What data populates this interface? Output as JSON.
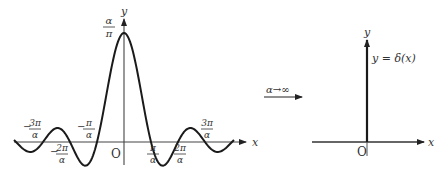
{
  "left_plot": {
    "x_axis_label": "x",
    "y_axis_label": "y",
    "origin_label": "O",
    "peak_label": {
      "num": "α",
      "den": "π"
    },
    "tick_labels": [
      {
        "sign": "−",
        "num": "3π",
        "den": "α",
        "x": 43,
        "pos": "above"
      },
      {
        "sign": "−",
        "num": "2π",
        "den": "α",
        "x": 70,
        "pos": "below"
      },
      {
        "sign": "−",
        "num": "π",
        "den": "α",
        "x": 97,
        "pos": "above"
      },
      {
        "sign": "",
        "num": "π",
        "den": "α",
        "x": 151,
        "pos": "below"
      },
      {
        "sign": "",
        "num": "2π",
        "den": "α",
        "x": 178,
        "pos": "below"
      },
      {
        "sign": "",
        "num": "3π",
        "den": "α",
        "x": 205,
        "pos": "above"
      }
    ],
    "function": "y = sin(αx)/(πx)"
  },
  "transition": {
    "label": "α→∞"
  },
  "right_plot": {
    "x_axis_label": "x",
    "y_axis_label": "y",
    "origin_label": "O",
    "function_label": "y = δ(x)"
  },
  "colors": {
    "curve": "#1a1a1a",
    "axis": "#333333",
    "text": "#333333"
  }
}
